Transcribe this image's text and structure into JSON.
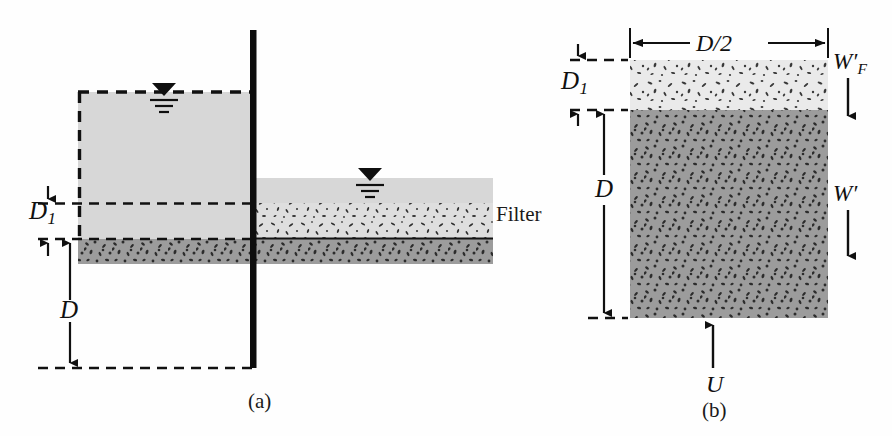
{
  "figure": {
    "panels": [
      {
        "id": "a",
        "caption": "(a)",
        "description": "Sheet pile wall cross-section with water, filter layer and soil",
        "labels": [
          {
            "name": "depth-d1",
            "text": "D",
            "subscript": "1"
          },
          {
            "name": "depth-d",
            "text": "D",
            "subscript": ""
          },
          {
            "name": "filter",
            "text": "Filter"
          }
        ],
        "symbols": [
          {
            "name": "water-table-upstream",
            "type": "water-table-symbol"
          },
          {
            "name": "water-table-downstream",
            "type": "water-table-symbol"
          }
        ]
      },
      {
        "id": "b",
        "caption": "(b)",
        "description": "Free body diagram of soil block with filter",
        "labels": [
          {
            "name": "width-d-over-2",
            "text": "D/2"
          },
          {
            "name": "depth-d1",
            "text": "D",
            "subscript": "1"
          },
          {
            "name": "depth-d",
            "text": "D",
            "subscript": ""
          },
          {
            "name": "filter-weight",
            "text": "W",
            "prime": "′",
            "subscript": "F"
          },
          {
            "name": "soil-weight",
            "text": "W",
            "prime": "′",
            "subscript": ""
          },
          {
            "name": "uplift-force",
            "text": "U"
          }
        ]
      }
    ],
    "colors": {
      "water": "#d6d6d6",
      "filter_light": "#e9e9e9",
      "soil_dark": "#9b9b9b",
      "line": "#151515",
      "wall": "#0d0d0d",
      "background": "#ffffff"
    }
  }
}
